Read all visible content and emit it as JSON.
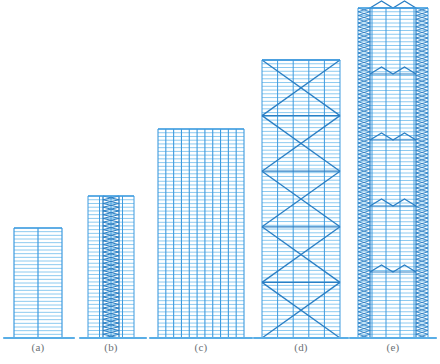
{
  "figure": {
    "background_color": "#ffffff",
    "line_color": "#3e9bdf",
    "line_color_light": "#8ccaf0",
    "line_color_dark": "#2b7fc4",
    "ground_color": "#5aaee6",
    "caption_color": "#6b7076",
    "width": 440,
    "height": 364
  },
  "chart_data": {
    "type": "diagram",
    "xlabel": "",
    "ylabel": "",
    "categories": [
      "(a)",
      "(b)",
      "(c)",
      "(d)",
      "(e)"
    ],
    "values": [
      110,
      142,
      209,
      278,
      330
    ],
    "series": [
      {
        "name": "building height (px)",
        "values": [
          110,
          142,
          209,
          278,
          330
        ]
      },
      {
        "name": "stories",
        "values": [
          30,
          38,
          56,
          74,
          88
        ]
      }
    ],
    "legend_position": "none",
    "grid": false
  },
  "buildings": [
    {
      "id": "a",
      "caption": "(a)",
      "system": "rigid-frame",
      "x": 14,
      "width": 48,
      "top": 228,
      "base": 338,
      "height": 110,
      "stories": 30,
      "bays": 2,
      "columns": 3,
      "caption_x": 38,
      "caption_y": 345
    },
    {
      "id": "b",
      "caption": "(b)",
      "system": "frame-with-braced-core",
      "x": 88,
      "width": 46,
      "top": 196,
      "base": 338,
      "height": 142,
      "stories": 38,
      "bays": 4,
      "columns": 5,
      "core_left": 103,
      "core_right": 119,
      "caption_x": 111,
      "caption_y": 345
    },
    {
      "id": "c",
      "caption": "(c)",
      "system": "framed-tube",
      "x": 158,
      "width": 86,
      "top": 129,
      "base": 338,
      "height": 209,
      "stories": 56,
      "bays": 11,
      "columns": 12,
      "caption_x": 201,
      "caption_y": 345
    },
    {
      "id": "d",
      "caption": "(d)",
      "system": "braced-tube",
      "x": 262,
      "width": 78,
      "top": 60,
      "base": 338,
      "height": 278,
      "stories": 74,
      "bays": 5,
      "columns": 6,
      "brace_modules": 5,
      "caption_x": 301,
      "caption_y": 345
    },
    {
      "id": "e",
      "caption": "(e)",
      "system": "bundled-tube-with-belt-trusses",
      "x": 358,
      "width": 70,
      "top": 8,
      "base": 338,
      "height": 330,
      "stories": 88,
      "bays": 5,
      "columns": 6,
      "belt_truss_count": 4,
      "lattice_edge_width": 12,
      "caption_x": 393,
      "caption_y": 345
    }
  ],
  "ground_lines": [
    {
      "name": "ground-line-a",
      "x1": 4,
      "x2": 74,
      "y": 338
    },
    {
      "name": "ground-line-b",
      "x1": 80,
      "x2": 146,
      "y": 338
    },
    {
      "name": "ground-line-c",
      "x1": 150,
      "x2": 252,
      "y": 338
    },
    {
      "name": "ground-line-d",
      "x1": 254,
      "x2": 348,
      "y": 338
    },
    {
      "name": "ground-line-e",
      "x1": 350,
      "x2": 436,
      "y": 338
    }
  ]
}
